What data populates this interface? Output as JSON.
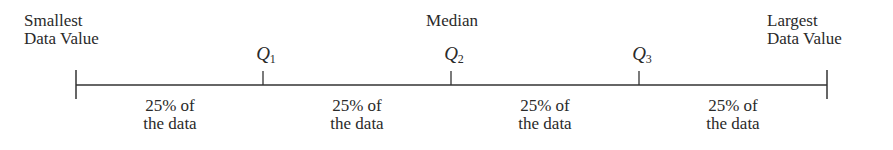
{
  "diagram": {
    "title": "",
    "type": "number-line-quartiles",
    "end_labels": {
      "left": [
        "Smallest",
        "Data Value"
      ],
      "right": [
        "Largest",
        "Data Value"
      ]
    },
    "median_label": "Median",
    "quartiles": [
      {
        "symbol": "Q",
        "sub": "1"
      },
      {
        "symbol": "Q",
        "sub": "2"
      },
      {
        "symbol": "Q",
        "sub": "3"
      }
    ],
    "segments": [
      {
        "line1": "25% of",
        "line2": "the data"
      },
      {
        "line1": "25% of",
        "line2": "the data"
      },
      {
        "line1": "25% of",
        "line2": "the data"
      },
      {
        "line1": "25% of",
        "line2": "the data"
      }
    ],
    "line_color": "#333333"
  }
}
